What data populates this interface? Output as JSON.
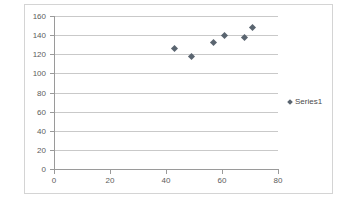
{
  "chart_data": {
    "type": "scatter",
    "title": "",
    "subtitle": "",
    "xlabel": "",
    "ylabel": "",
    "xlim": [
      0,
      80
    ],
    "ylim": [
      0,
      160
    ],
    "x_ticks": [
      0,
      20,
      40,
      60,
      80
    ],
    "y_ticks": [
      0,
      20,
      40,
      60,
      80,
      100,
      120,
      140,
      160
    ],
    "grid": "horizontal",
    "legend_position": "right",
    "marker": "diamond",
    "marker_color": "#5a6570",
    "gridline_color": "#c9c9c9",
    "axis_color": "#9a9a9a",
    "border_color": "#d4d4d4",
    "background": "#ffffff",
    "series": [
      {
        "name": "Series1",
        "points": [
          {
            "x": 43,
            "y": 126
          },
          {
            "x": 49,
            "y": 118
          },
          {
            "x": 57,
            "y": 132
          },
          {
            "x": 61,
            "y": 140
          },
          {
            "x": 68,
            "y": 137
          },
          {
            "x": 71,
            "y": 148
          }
        ]
      }
    ]
  },
  "legend": {
    "entries": [
      {
        "label": "Series1"
      }
    ]
  }
}
